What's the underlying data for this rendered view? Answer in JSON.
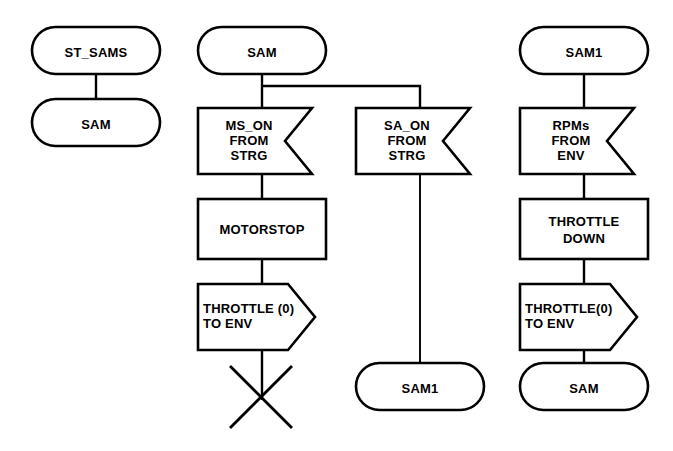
{
  "diagram": {
    "background_color": "#ffffff",
    "line_color": "#000000",
    "fill_color": "#ffffff"
  },
  "columns": [
    {
      "id": "column-start",
      "nodes": [
        {
          "id": "node-st-sams",
          "kind": "state",
          "text": "ST_SAMS"
        },
        {
          "id": "node-sam-start",
          "kind": "state",
          "text": "SAM"
        }
      ]
    },
    {
      "id": "column-ms-on",
      "nodes": [
        {
          "id": "node-sam-state",
          "kind": "state",
          "text": "SAM"
        },
        {
          "id": "node-input-ms-on",
          "kind": "input",
          "lines": [
            "MS_ON",
            "FROM",
            "STRG"
          ]
        },
        {
          "id": "node-task-motorstop",
          "kind": "task",
          "lines": [
            "MOTORSTOP"
          ]
        },
        {
          "id": "node-output-throttle-0",
          "kind": "output",
          "lines": [
            "THROTTLE (0)",
            "TO ENV"
          ]
        },
        {
          "id": "node-stop-terminator",
          "kind": "stop",
          "text": ""
        }
      ]
    },
    {
      "id": "column-sa-on",
      "nodes": [
        {
          "id": "node-input-sa-on",
          "kind": "input",
          "lines": [
            "SA_ON",
            "FROM",
            "STRG"
          ]
        },
        {
          "id": "node-sam1-next",
          "kind": "state",
          "text": "SAM1"
        }
      ]
    },
    {
      "id": "column-rpms",
      "nodes": [
        {
          "id": "node-sam1-state",
          "kind": "state",
          "text": "SAM1"
        },
        {
          "id": "node-input-rpms",
          "kind": "input",
          "lines": [
            "RPMs",
            "FROM",
            "ENV"
          ]
        },
        {
          "id": "node-task-throttle-down",
          "kind": "task",
          "lines": [
            "THROTTLE",
            "DOWN"
          ]
        },
        {
          "id": "node-output-throttle-0-env",
          "kind": "output",
          "lines": [
            "THROTTLE(0)",
            "TO ENV"
          ]
        },
        {
          "id": "node-sam-next",
          "kind": "state",
          "text": "SAM"
        }
      ]
    }
  ],
  "labels": {
    "st_sams": "ST_SAMS",
    "sam_start": "SAM",
    "sam_state": "SAM",
    "ms_on_l1": "MS_ON",
    "ms_on_l2": "FROM",
    "ms_on_l3": "STRG",
    "motorstop": "MOTORSTOP",
    "throttle0_l1": "THROTTLE (0)",
    "throttle0_l2": "TO ENV",
    "sa_on_l1": "SA_ON",
    "sa_on_l2": "FROM",
    "sa_on_l3": "STRG",
    "sam1_next": "SAM1",
    "sam1_state": "SAM1",
    "rpms_l1": "RPMs",
    "rpms_l2": "FROM",
    "rpms_l3": "ENV",
    "throttle_down_l1": "THROTTLE",
    "throttle_down_l2": "DOWN",
    "throttle0env_l1": "THROTTLE(0)",
    "throttle0env_l2": "TO ENV",
    "sam_next": "SAM"
  }
}
